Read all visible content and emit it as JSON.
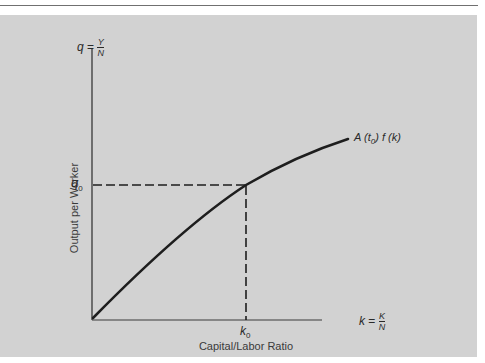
{
  "diagram": {
    "title": "",
    "y_axis": {
      "symbol": "q",
      "equals": "=",
      "numerator": "Y",
      "denominator": "N",
      "label": "Output per Worker",
      "marker": "q",
      "marker_sub": "0"
    },
    "x_axis": {
      "symbol": "k",
      "equals": "=",
      "numerator": "K",
      "denominator": "N",
      "label": "Capital/Labor Ratio",
      "marker": "k",
      "marker_sub": "0"
    },
    "curve": {
      "label_prefix": "A (t",
      "label_sub": "0",
      "label_suffix": ") f (k)"
    },
    "colors": {
      "panel": "#d2d2d2",
      "ink": "#2a2a2a",
      "rule": "#707070"
    }
  }
}
